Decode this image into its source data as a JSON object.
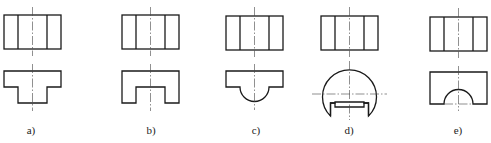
{
  "figure": {
    "panels": [
      {
        "id": "a",
        "label": "a)",
        "front_view_shape": "inverted-T (cap with narrow stem)"
      },
      {
        "id": "b",
        "label": "b)",
        "front_view_shape": "block with rectangular notch cut from bottom"
      },
      {
        "id": "c",
        "label": "c)",
        "front_view_shape": "slab with semicircular bulge below"
      },
      {
        "id": "d",
        "label": "d)",
        "front_view_shape": "truncated circle with rectangular slot"
      },
      {
        "id": "e",
        "label": "e)",
        "front_view_shape": "block with semicircular arch cut into bottom"
      }
    ],
    "top_view": "rectangle divided into three vertical bands",
    "colors": {
      "line": "#1a1a1a",
      "centerline": "#444444",
      "background": "#ffffff"
    }
  }
}
